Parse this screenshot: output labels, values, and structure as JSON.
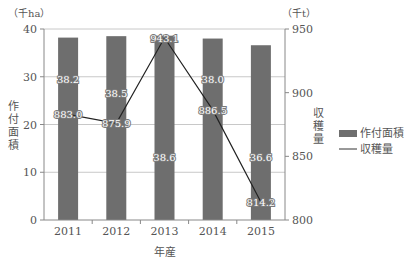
{
  "chart_data": {
    "type": "bar",
    "combo": "bar+line (dual axis)",
    "categories": [
      "2011",
      "2012",
      "2013",
      "2014",
      "2015"
    ],
    "series": [
      {
        "name": "作付面積",
        "type": "bar",
        "axis": "left",
        "values": [
          38.2,
          38.5,
          38.6,
          38.0,
          36.6
        ],
        "color": "#6e6e6e"
      },
      {
        "name": "収穫量",
        "type": "line",
        "axis": "right",
        "values": [
          883.0,
          875.9,
          943.1,
          886.5,
          814.2
        ],
        "color": "#222222"
      }
    ],
    "xlabel": "年産",
    "ylabel_left": "作付面積",
    "ylabel_right": "収穫量",
    "unit_left": "（千ha）",
    "unit_right": "（千t）",
    "ylim_left": [
      0,
      40
    ],
    "yticks_left": [
      "0",
      "10",
      "20",
      "30",
      "40"
    ],
    "ylim_right": [
      800,
      950
    ],
    "yticks_right": [
      "800",
      "850",
      "900",
      "950"
    ],
    "grid": true,
    "legend_position": "right",
    "legend": [
      {
        "label": "作付面積",
        "symbol": "bar"
      },
      {
        "label": "収穫量",
        "symbol": "line"
      }
    ],
    "bar_labels": [
      "38.2",
      "38.5",
      "38.6",
      "38.0",
      "36.6"
    ],
    "line_labels": [
      "883.0",
      "875.9",
      "943.1",
      "886.5",
      "814.2"
    ]
  }
}
